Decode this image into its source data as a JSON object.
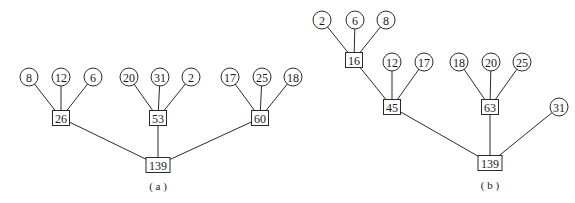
{
  "diagrams": [
    {
      "caption": "( a )",
      "caption_pos": [
        158,
        186
      ],
      "nodes": [
        {
          "id": "a-8",
          "label": "8",
          "shape": "circle",
          "x": 29,
          "y": 77
        },
        {
          "id": "a-12",
          "label": "12",
          "shape": "circle",
          "x": 61,
          "y": 77
        },
        {
          "id": "a-6",
          "label": "6",
          "shape": "circle",
          "x": 93,
          "y": 77
        },
        {
          "id": "a-20",
          "label": "20",
          "shape": "circle",
          "x": 129,
          "y": 77
        },
        {
          "id": "a-31",
          "label": "31",
          "shape": "circle",
          "x": 160,
          "y": 77
        },
        {
          "id": "a-2",
          "label": "2",
          "shape": "circle",
          "x": 191,
          "y": 77
        },
        {
          "id": "a-17",
          "label": "17",
          "shape": "circle",
          "x": 230,
          "y": 77
        },
        {
          "id": "a-25",
          "label": "25",
          "shape": "circle",
          "x": 262,
          "y": 77
        },
        {
          "id": "a-18",
          "label": "18",
          "shape": "circle",
          "x": 293,
          "y": 77
        },
        {
          "id": "a-26",
          "label": "26",
          "shape": "square",
          "x": 61,
          "y": 118
        },
        {
          "id": "a-53",
          "label": "53",
          "shape": "square",
          "x": 158,
          "y": 118
        },
        {
          "id": "a-60",
          "label": "60",
          "shape": "square",
          "x": 260,
          "y": 118
        },
        {
          "id": "a-139",
          "label": "139",
          "shape": "square",
          "x": 158,
          "y": 165
        }
      ],
      "edges": [
        [
          "a-8",
          "a-26"
        ],
        [
          "a-12",
          "a-26"
        ],
        [
          "a-6",
          "a-26"
        ],
        [
          "a-20",
          "a-53"
        ],
        [
          "a-31",
          "a-53"
        ],
        [
          "a-2",
          "a-53"
        ],
        [
          "a-17",
          "a-60"
        ],
        [
          "a-25",
          "a-60"
        ],
        [
          "a-18",
          "a-60"
        ],
        [
          "a-26",
          "a-139"
        ],
        [
          "a-53",
          "a-139"
        ],
        [
          "a-60",
          "a-139"
        ]
      ]
    },
    {
      "caption": "( b )",
      "caption_pos": [
        490,
        185
      ],
      "nodes": [
        {
          "id": "b-2",
          "label": "2",
          "shape": "circle",
          "x": 322,
          "y": 20
        },
        {
          "id": "b-6",
          "label": "6",
          "shape": "circle",
          "x": 355,
          "y": 20
        },
        {
          "id": "b-8",
          "label": "8",
          "shape": "circle",
          "x": 386,
          "y": 20
        },
        {
          "id": "b-16",
          "label": "16",
          "shape": "square",
          "x": 354,
          "y": 60
        },
        {
          "id": "b-12",
          "label": "12",
          "shape": "circle",
          "x": 392,
          "y": 62
        },
        {
          "id": "b-17",
          "label": "17",
          "shape": "circle",
          "x": 424,
          "y": 62
        },
        {
          "id": "b-45",
          "label": "45",
          "shape": "square",
          "x": 392,
          "y": 107
        },
        {
          "id": "b-18",
          "label": "18",
          "shape": "circle",
          "x": 459,
          "y": 62
        },
        {
          "id": "b-20",
          "label": "20",
          "shape": "circle",
          "x": 491,
          "y": 62
        },
        {
          "id": "b-25",
          "label": "25",
          "shape": "circle",
          "x": 522,
          "y": 62
        },
        {
          "id": "b-63",
          "label": "63",
          "shape": "square",
          "x": 490,
          "y": 107
        },
        {
          "id": "b-31",
          "label": "31",
          "shape": "circle",
          "x": 559,
          "y": 107
        },
        {
          "id": "b-139",
          "label": "139",
          "shape": "square",
          "x": 490,
          "y": 163
        }
      ],
      "edges": [
        [
          "b-2",
          "b-16"
        ],
        [
          "b-6",
          "b-16"
        ],
        [
          "b-8",
          "b-16"
        ],
        [
          "b-16",
          "b-45"
        ],
        [
          "b-12",
          "b-45"
        ],
        [
          "b-17",
          "b-45"
        ],
        [
          "b-18",
          "b-63"
        ],
        [
          "b-20",
          "b-63"
        ],
        [
          "b-25",
          "b-63"
        ],
        [
          "b-45",
          "b-139"
        ],
        [
          "b-63",
          "b-139"
        ],
        [
          "b-31",
          "b-139"
        ]
      ]
    }
  ],
  "style": {
    "stroke_color": "#2a2a2a",
    "background": "#ffffff",
    "circle_radius": 9,
    "square_height": 15
  }
}
